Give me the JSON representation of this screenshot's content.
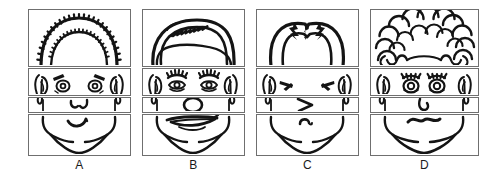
{
  "page": {
    "background_color": "#ffffff",
    "ink_color": "#141414",
    "frame_color": "#6f6f6f",
    "width": 497,
    "height": 177
  },
  "strip_rows": [
    {
      "key": "hair",
      "name": "hair-strip",
      "label": "hair"
    },
    {
      "key": "eyes",
      "name": "eyes-strip",
      "label": "eyes and ears"
    },
    {
      "key": "nose",
      "name": "nose-strip",
      "label": "nose"
    },
    {
      "key": "mouth",
      "name": "mouth-strip",
      "label": "mouth and chin"
    }
  ],
  "faces": [
    {
      "id": "A",
      "label": "A",
      "x": 28,
      "width": 103,
      "hair": "short spiky bristly hair with fringe",
      "eyes": "round open eyes with slanted eyebrows",
      "nose": "small pointed nose",
      "mouth": "small smiling mouth"
    },
    {
      "id": "B",
      "label": "B",
      "x": 142,
      "width": 103,
      "hair": "smooth swept-over hair with side part",
      "eyes": "eyes with thick eyelashes",
      "nose": "large round nose",
      "mouth": "wide frowning lips"
    },
    {
      "id": "C",
      "label": "C",
      "x": 256,
      "width": 103,
      "hair": "hair parted in middle with widow's peak",
      "eyes": "closed squinting eyes",
      "nose": "sharp angular pointed nose",
      "mouth": "tiny curved mouth"
    },
    {
      "id": "D",
      "label": "D",
      "x": 370,
      "width": 109,
      "hair": "curly bubbly afro hair",
      "eyes": "round eyes with short lashes",
      "nose": "small hooked nose",
      "mouth": "wavy squiggly mouth"
    }
  ]
}
